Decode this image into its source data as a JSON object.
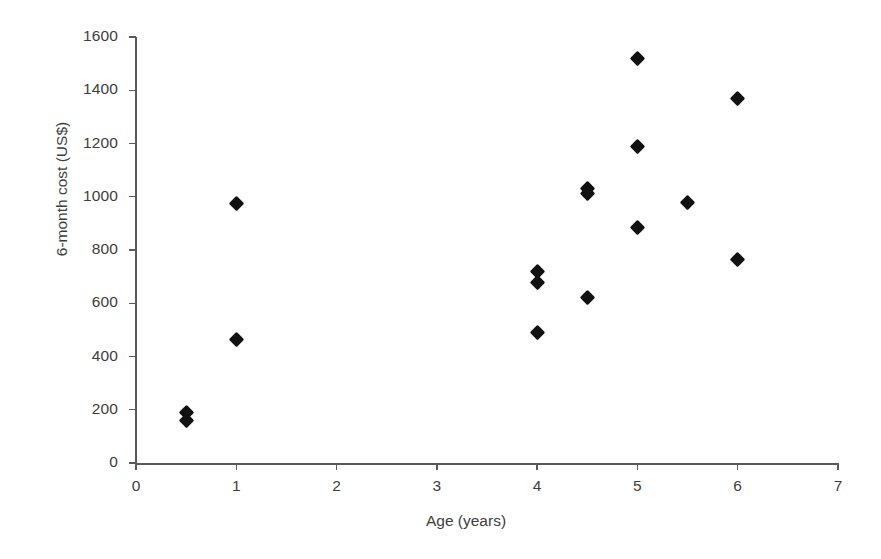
{
  "chart_data": {
    "type": "scatter",
    "title": "",
    "xlabel": "Age (years)",
    "ylabel": "6-month cost (US$)",
    "xlim": [
      0,
      7
    ],
    "ylim": [
      0,
      1600
    ],
    "xticks": [
      0,
      1,
      2,
      3,
      4,
      5,
      6,
      7
    ],
    "xtick_labels": [
      "0",
      "1",
      "2",
      "3",
      "4",
      "5",
      "6",
      "7"
    ],
    "yticks": [
      0,
      200,
      400,
      600,
      800,
      1000,
      1200,
      1400,
      1600
    ],
    "ytick_labels": [
      "0",
      "200",
      "400",
      "600",
      "800",
      "1000",
      "1200",
      "1400",
      "1600"
    ],
    "grid": false,
    "legend": false,
    "marker": "diamond",
    "marker_color": "#111111",
    "points": [
      {
        "x": 0.5,
        "y": 190
      },
      {
        "x": 0.5,
        "y": 158
      },
      {
        "x": 1.0,
        "y": 975
      },
      {
        "x": 1.0,
        "y": 463
      },
      {
        "x": 4.0,
        "y": 718
      },
      {
        "x": 4.0,
        "y": 678
      },
      {
        "x": 4.0,
        "y": 492
      },
      {
        "x": 4.5,
        "y": 1032
      },
      {
        "x": 4.5,
        "y": 1012
      },
      {
        "x": 4.5,
        "y": 620
      },
      {
        "x": 5.0,
        "y": 1520
      },
      {
        "x": 5.0,
        "y": 1190
      },
      {
        "x": 5.0,
        "y": 884
      },
      {
        "x": 5.5,
        "y": 978
      },
      {
        "x": 6.0,
        "y": 1368
      },
      {
        "x": 6.0,
        "y": 764
      }
    ]
  },
  "axes": {
    "x_title": "Age (years)",
    "y_title": "6-month cost (US$)"
  }
}
